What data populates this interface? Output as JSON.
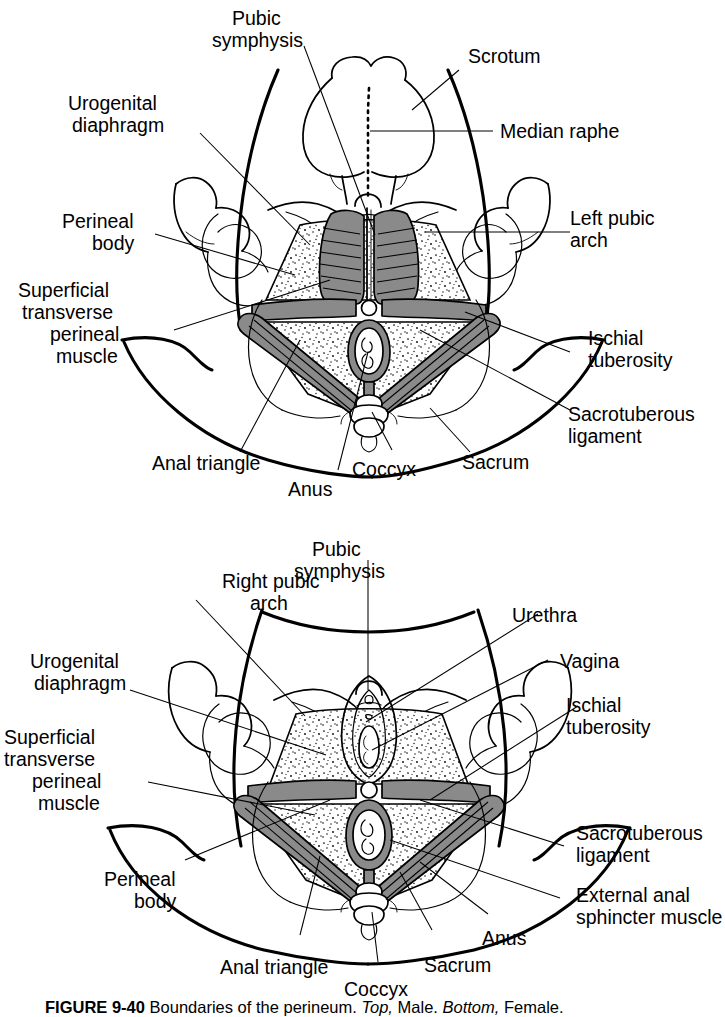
{
  "figure": {
    "caption_number": "FIGURE 9-40",
    "caption_text": "Boundaries of the perineum.",
    "caption_top_word": "Top,",
    "caption_top_value": "Male.",
    "caption_bottom_word": "Bottom,",
    "caption_bottom_value": "Female.",
    "colors": {
      "ink": "#000000",
      "muscle_gray": "#8a8a8a",
      "background": "#ffffff"
    }
  },
  "panels": [
    {
      "id": "male-perineum",
      "title": "Top, Male",
      "labels": [
        {
          "key": "pubic-symphysis",
          "text": "Pubic\nsymphysis",
          "lines": [
            "Pubic",
            "symphysis"
          ]
        },
        {
          "key": "scrotum",
          "text": "Scrotum",
          "lines": [
            "Scrotum"
          ]
        },
        {
          "key": "median-raphe",
          "text": "Median raphe",
          "lines": [
            "Median raphe"
          ]
        },
        {
          "key": "urogenital-diaphragm",
          "text": "Urogenital\ndiaphragm",
          "lines": [
            "Urogenital",
            "diaphragm"
          ]
        },
        {
          "key": "perineal-body",
          "text": "Perineal\nbody",
          "lines": [
            "Perineal",
            "body"
          ]
        },
        {
          "key": "left-pubic-arch",
          "text": "Left pubic\narch",
          "lines": [
            "Left pubic",
            "arch"
          ]
        },
        {
          "key": "superficial-transverse-perineal-muscle",
          "text": "Superficial\ntransverse\nperineal\nmuscle",
          "lines": [
            "Superficial",
            "transverse",
            "perineal",
            "muscle"
          ]
        },
        {
          "key": "ischial-tuberosity",
          "text": "Ischial\ntuberosity",
          "lines": [
            "Ischial",
            "tuberosity"
          ]
        },
        {
          "key": "sacrotuberous-ligament",
          "text": "Sacrotuberous\nligament",
          "lines": [
            "Sacrotuberous",
            "ligament"
          ]
        },
        {
          "key": "anal-triangle",
          "text": "Anal triangle",
          "lines": [
            "Anal triangle"
          ]
        },
        {
          "key": "anus",
          "text": "Anus",
          "lines": [
            "Anus"
          ]
        },
        {
          "key": "coccyx",
          "text": "Coccyx",
          "lines": [
            "Coccyx"
          ]
        },
        {
          "key": "sacrum",
          "text": "Sacrum",
          "lines": [
            "Sacrum"
          ]
        }
      ]
    },
    {
      "id": "female-perineum",
      "title": "Bottom, Female",
      "labels": [
        {
          "key": "right-pubic-arch",
          "text": "Right pubic\narch",
          "lines": [
            "Right pubic",
            "arch"
          ]
        },
        {
          "key": "pubic-symphysis",
          "text": "Pubic\nsymphysis",
          "lines": [
            "Pubic",
            "symphysis"
          ]
        },
        {
          "key": "urethra",
          "text": "Urethra",
          "lines": [
            "Urethra"
          ]
        },
        {
          "key": "vagina",
          "text": "Vagina",
          "lines": [
            "Vagina"
          ]
        },
        {
          "key": "urogenital-diaphragm",
          "text": "Urogenital\ndiaphragm",
          "lines": [
            "Urogenital",
            "diaphragm"
          ]
        },
        {
          "key": "ischial-tuberosity",
          "text": "Ischial\ntuberosity",
          "lines": [
            "Ischial",
            "tuberosity"
          ]
        },
        {
          "key": "superficial-transverse-perineal-muscle",
          "text": "Superficial\ntransverse\nperineal\nmuscle",
          "lines": [
            "Superficial",
            "transverse",
            "perineal",
            "muscle"
          ]
        },
        {
          "key": "sacrotuberous-ligament",
          "text": "Sacrotuberous\nligament",
          "lines": [
            "Sacrotuberous",
            "ligament"
          ]
        },
        {
          "key": "perineal-body",
          "text": "Perineal\nbody",
          "lines": [
            "Perineal",
            "body"
          ]
        },
        {
          "key": "external-anal-sphincter-muscle",
          "text": "External anal\nsphincter muscle",
          "lines": [
            "External anal",
            "sphincter muscle"
          ]
        },
        {
          "key": "anal-triangle",
          "text": "Anal triangle",
          "lines": [
            "Anal triangle"
          ]
        },
        {
          "key": "coccyx",
          "text": "Coccyx",
          "lines": [
            "Coccyx"
          ]
        },
        {
          "key": "sacrum",
          "text": "Sacrum",
          "lines": [
            "Sacrum"
          ]
        },
        {
          "key": "anus",
          "text": "Anus",
          "lines": [
            "Anus"
          ]
        }
      ]
    }
  ],
  "male": {
    "pubic_symphysis_l1": "Pubic",
    "pubic_symphysis_l2": "symphysis",
    "scrotum": "Scrotum",
    "median_raphe": "Median raphe",
    "urogenital_diaphragm_l1": "Urogenital",
    "urogenital_diaphragm_l2": "diaphragm",
    "perineal_body_l1": "Perineal",
    "perineal_body_l2": "body",
    "left_pubic_arch_l1": "Left pubic",
    "left_pubic_arch_l2": "arch",
    "stpm_l1": "Superficial",
    "stpm_l2": "transverse",
    "stpm_l3": "perineal",
    "stpm_l4": "muscle",
    "ischial_tuberosity_l1": "Ischial",
    "ischial_tuberosity_l2": "tuberosity",
    "sacrotuberous_l1": "Sacrotuberous",
    "sacrotuberous_l2": "ligament",
    "anal_triangle": "Anal triangle",
    "anus": "Anus",
    "coccyx": "Coccyx",
    "sacrum": "Sacrum"
  },
  "female": {
    "right_pubic_arch_l1": "Right pubic",
    "right_pubic_arch_l2": "arch",
    "pubic_symphysis_l1": "Pubic",
    "pubic_symphysis_l2": "symphysis",
    "urethra": "Urethra",
    "vagina": "Vagina",
    "urogenital_diaphragm_l1": "Urogenital",
    "urogenital_diaphragm_l2": "diaphragm",
    "ischial_tuberosity_l1": "Ischial",
    "ischial_tuberosity_l2": "tuberosity",
    "stpm_l1": "Superficial",
    "stpm_l2": "transverse",
    "stpm_l3": "perineal",
    "stpm_l4": "muscle",
    "sacrotuberous_l1": "Sacrotuberous",
    "sacrotuberous_l2": "ligament",
    "perineal_body_l1": "Perineal",
    "perineal_body_l2": "body",
    "external_anal_sphincter_l1": "External anal",
    "external_anal_sphincter_l2": "sphincter muscle",
    "anal_triangle": "Anal triangle",
    "coccyx": "Coccyx",
    "sacrum": "Sacrum",
    "anus": "Anus"
  }
}
